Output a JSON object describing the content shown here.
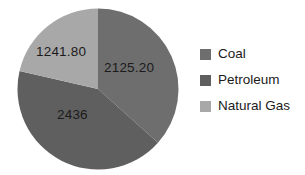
{
  "chart_data": {
    "type": "pie",
    "title": "",
    "categories": [
      "Coal",
      "Petroleum",
      "Natural Gas"
    ],
    "values": [
      2125.2,
      2436,
      1241.8
    ],
    "labels": [
      "2125.20",
      "2436",
      "1241.80"
    ],
    "colors": [
      "#6e6e6e",
      "#5f5f5f",
      "#a8a8a8"
    ],
    "legend_position": "right",
    "start_angle_deg": 0,
    "direction": "clockwise",
    "grid": false
  },
  "pie": {
    "slices": [
      {
        "name": "Coal",
        "label": "2125.20",
        "color": "#6e6e6e"
      },
      {
        "name": "Petroleum",
        "label": "2436",
        "color": "#5f5f5f"
      },
      {
        "name": "Natural Gas",
        "label": "1241.80",
        "color": "#a8a8a8"
      }
    ]
  },
  "legend": {
    "items": [
      {
        "label": "Coal",
        "color": "#6e6e6e"
      },
      {
        "label": "Petroleum",
        "color": "#5f5f5f"
      },
      {
        "label": "Natural Gas",
        "color": "#a8a8a8"
      }
    ]
  }
}
